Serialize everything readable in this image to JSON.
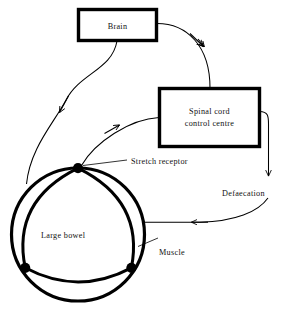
{
  "diagram": {
    "ink_color": "#000000",
    "background_color": "#ffffff",
    "boxes": [
      {
        "id": "brain",
        "label": "Brain"
      },
      {
        "id": "spinal-cord",
        "label_line1": "Spinal cord",
        "label_line2": "control centre"
      }
    ],
    "labels": [
      {
        "id": "stretch-receptor",
        "text": "Stretch receptor"
      },
      {
        "id": "defaecation",
        "text": "Defaecation"
      },
      {
        "id": "large-bowel",
        "text": "Large bowel"
      },
      {
        "id": "muscle",
        "text": "Muscle"
      }
    ],
    "nodes": {
      "receptor_count": 3
    }
  }
}
